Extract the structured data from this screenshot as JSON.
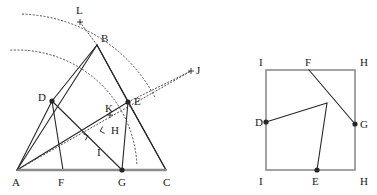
{
  "figure": {
    "background_color": "#ffffff",
    "stroke_color": "#262626",
    "base_line_color": "#8c8c8c",
    "dotted_color": "#4d4d4d",
    "label_color": "#1a1a1a"
  },
  "left_diagram": {
    "name": "triangle-construction",
    "points": {
      "A": {
        "x": 17,
        "y": 170,
        "label": "A",
        "label_x": 12,
        "label_y": 186,
        "marker": "none"
      },
      "B": {
        "x": 97,
        "y": 45,
        "label": "B",
        "label_x": 101,
        "label_y": 42,
        "marker": "none"
      },
      "C": {
        "x": 166,
        "y": 170,
        "label": "C",
        "label_x": 163,
        "label_y": 186,
        "marker": "none"
      },
      "D": {
        "x": 52,
        "y": 101,
        "label": "D",
        "label_x": 38,
        "label_y": 101,
        "marker": "dot"
      },
      "E": {
        "x": 128,
        "y": 102,
        "label": "E",
        "label_x": 134,
        "label_y": 105,
        "marker": "dot"
      },
      "F": {
        "x": 63,
        "y": 170,
        "label": "F",
        "label_x": 58,
        "label_y": 186,
        "marker": "none"
      },
      "G": {
        "x": 122,
        "y": 170,
        "label": "G",
        "label_x": 118,
        "label_y": 186,
        "marker": "dot"
      },
      "H": {
        "x": 107,
        "y": 129,
        "label": "H",
        "label_x": 111,
        "label_y": 134,
        "marker": "none"
      },
      "I": {
        "x": 100,
        "y": 152,
        "label": "I",
        "label_x": 97,
        "label_y": 156,
        "marker": "none"
      },
      "K": {
        "x": 110,
        "y": 115,
        "label": "K",
        "label_x": 105,
        "label_y": 112,
        "marker": "plus"
      },
      "L": {
        "x": 80,
        "y": 22,
        "label": "L",
        "label_x": 76,
        "label_y": 14,
        "marker": "plus"
      },
      "J": {
        "x": 191,
        "y": 71,
        "label": "J",
        "label_x": 196,
        "label_y": 74,
        "marker": "plus"
      }
    },
    "solid_segments": [
      {
        "name": "segment-A-B",
        "from": "A",
        "to": "B"
      },
      {
        "name": "segment-B-C",
        "from": "B",
        "to": "C"
      },
      {
        "name": "segment-A-D",
        "from": "A",
        "to": "D"
      },
      {
        "name": "segment-D-B",
        "from": "D",
        "to": "B"
      },
      {
        "name": "segment-B-E",
        "from": "B",
        "to": "E"
      },
      {
        "name": "segment-E-C",
        "from": "E",
        "to": "C"
      },
      {
        "name": "segment-D-F",
        "from": "D",
        "to": "F"
      },
      {
        "name": "segment-A-E",
        "from": "A",
        "to": "E"
      },
      {
        "name": "segment-E-G",
        "from": "E",
        "to": "G"
      },
      {
        "name": "segment-D-G",
        "from": "D",
        "to": "G"
      }
    ],
    "base_segment": {
      "name": "segment-A-C",
      "from": "A",
      "to": "C"
    },
    "dotted_segments": [
      {
        "name": "dotted-L-B",
        "x1": 80,
        "y1": 22,
        "x2": 97,
        "y2": 45
      },
      {
        "name": "dotted-A-J",
        "x1": 17,
        "y1": 170,
        "x2": 191,
        "y2": 71
      },
      {
        "name": "dotted-E-J",
        "x1": 128,
        "y1": 102,
        "x2": 191,
        "y2": 71
      }
    ],
    "dotted_arcs": [
      {
        "name": "arc-outer-A-L",
        "cx": 17,
        "cy": 170,
        "r": 156,
        "start_deg": 88,
        "end_deg": 28
      },
      {
        "name": "arc-inner-A-F",
        "cx": 17,
        "cy": 170,
        "r": 120,
        "start_deg": 93,
        "end_deg": 2
      }
    ],
    "right_angle_marks": [
      {
        "name": "right-angle-mark-foot",
        "x": 81,
        "y": 138,
        "rotation": 27
      },
      {
        "name": "right-angle-mark-H",
        "x": 107,
        "y": 129,
        "rotation": 208
      }
    ]
  },
  "right_diagram": {
    "name": "square-construction",
    "square": {
      "left": 266,
      "top": 70,
      "right": 355,
      "bottom": 170
    },
    "points": {
      "I_top": {
        "x": 266,
        "y": 70,
        "label": "I",
        "label_x": 259,
        "label_y": 66,
        "marker": "none"
      },
      "F": {
        "x": 309,
        "y": 70,
        "label": "F",
        "label_x": 305,
        "label_y": 66,
        "marker": "none"
      },
      "H_top": {
        "x": 355,
        "y": 70,
        "label": "H",
        "label_x": 360,
        "label_y": 66,
        "marker": "none"
      },
      "D": {
        "x": 266,
        "y": 122,
        "label": "D",
        "label_x": 255,
        "label_y": 126,
        "marker": "dot"
      },
      "G": {
        "x": 355,
        "y": 124,
        "label": "G",
        "label_x": 360,
        "label_y": 128,
        "marker": "dot"
      },
      "I_bottom": {
        "x": 266,
        "y": 170,
        "label": "I",
        "label_x": 259,
        "label_y": 185,
        "marker": "none"
      },
      "E": {
        "x": 317,
        "y": 170,
        "label": "E",
        "label_x": 312,
        "label_y": 185,
        "marker": "dot"
      },
      "H_bottom": {
        "x": 355,
        "y": 170,
        "label": "H",
        "label_x": 360,
        "label_y": 185,
        "marker": "none"
      },
      "P": {
        "x": 327,
        "y": 103,
        "label": "",
        "label_x": 327,
        "label_y": 103,
        "marker": "none"
      }
    },
    "inner_segments": [
      {
        "name": "segment-F-G",
        "from": "F",
        "to": "G"
      },
      {
        "name": "segment-D-P",
        "from": "D",
        "to": "P"
      },
      {
        "name": "segment-P-E",
        "from": "P",
        "to": "E"
      }
    ]
  }
}
